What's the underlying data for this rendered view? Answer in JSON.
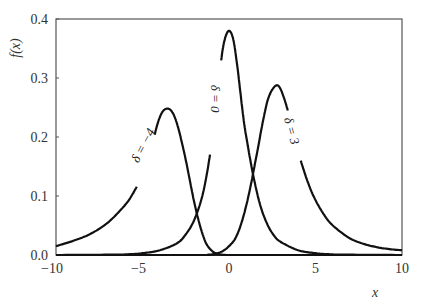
{
  "chart_data": {
    "type": "line",
    "title": "",
    "xlabel": "x",
    "ylabel": "f(x)",
    "xlim": [
      -10,
      10
    ],
    "ylim": [
      0.0,
      0.4
    ],
    "xticks": [
      -10,
      -5,
      0,
      5,
      10
    ],
    "xtick_labels": [
      "−10",
      "−5",
      "0",
      "5",
      "10"
    ],
    "yticks": [
      0.0,
      0.1,
      0.2,
      0.3,
      0.4
    ],
    "ytick_labels": [
      "0.0",
      "0.1",
      "0.2",
      "0.3",
      "0.4"
    ],
    "grid": false,
    "legend": "none (inline curve labels)",
    "line_color": "#111111",
    "series": [
      {
        "name": "δ = −4",
        "label_text": "δ = −4",
        "label_pos": {
          "x": -4.9,
          "y": 0.185,
          "angle": -62
        },
        "gap": [
          -5.3,
          -4.3
        ],
        "x": [
          -10,
          -9,
          -8,
          -7,
          -6,
          -5.5,
          -5,
          -4.6,
          -4.2,
          -3.9,
          -3.6,
          -3.3,
          -3.0,
          -2.6,
          -2.2,
          -2.0,
          -1.7,
          -1.4,
          -1.2,
          -0.9,
          -0.6,
          -0.3,
          0,
          1,
          2,
          4,
          10
        ],
        "values": [
          0.015,
          0.024,
          0.036,
          0.055,
          0.085,
          0.107,
          0.135,
          0.165,
          0.215,
          0.24,
          0.248,
          0.243,
          0.222,
          0.175,
          0.117,
          0.088,
          0.052,
          0.025,
          0.014,
          0.005,
          0.0015,
          0.0003,
          0.0,
          0.0,
          0.0,
          0.0,
          0.0
        ]
      },
      {
        "name": "δ = 0",
        "label_text": "δ = 0",
        "label_pos": {
          "x": -0.85,
          "y": 0.265,
          "angle": 90
        },
        "gap": [
          -1.1,
          -0.45
        ],
        "x": [
          -10,
          -7,
          -6,
          -5,
          -4,
          -3,
          -2.5,
          -2,
          -1.5,
          -1.1,
          -0.8,
          -0.45,
          -0.25,
          0,
          0.25,
          0.5,
          0.8,
          1.0,
          1.4,
          1.8,
          2.2,
          2.6,
          3,
          4,
          5,
          6,
          7,
          10
        ],
        "values": [
          0.0,
          0.0005,
          0.001,
          0.003,
          0.008,
          0.02,
          0.035,
          0.06,
          0.105,
          0.17,
          0.24,
          0.33,
          0.365,
          0.38,
          0.365,
          0.315,
          0.24,
          0.2,
          0.135,
          0.085,
          0.053,
          0.033,
          0.022,
          0.008,
          0.003,
          0.001,
          0.0005,
          0.0
        ]
      },
      {
        "name": "δ = 3",
        "label_text": "δ = 3",
        "label_pos": {
          "x": 3.55,
          "y": 0.21,
          "angle": 75
        },
        "gap": [
          3.4,
          4.15
        ],
        "x": [
          -10,
          -2,
          -1.2,
          -0.8,
          -0.4,
          0,
          0.4,
          0.8,
          1.2,
          1.6,
          2.0,
          2.3,
          2.7,
          3.0,
          3.4,
          3.7,
          4.15,
          4.6,
          5,
          5.5,
          6,
          7,
          8,
          9,
          10
        ],
        "values": [
          0.0,
          0.0,
          0.0005,
          0.002,
          0.006,
          0.015,
          0.03,
          0.062,
          0.11,
          0.17,
          0.232,
          0.268,
          0.287,
          0.28,
          0.245,
          0.21,
          0.16,
          0.12,
          0.093,
          0.068,
          0.05,
          0.028,
          0.017,
          0.011,
          0.008
        ]
      }
    ]
  },
  "plot_area": {
    "left": 56,
    "right": 402,
    "top": 19,
    "bottom": 255
  }
}
